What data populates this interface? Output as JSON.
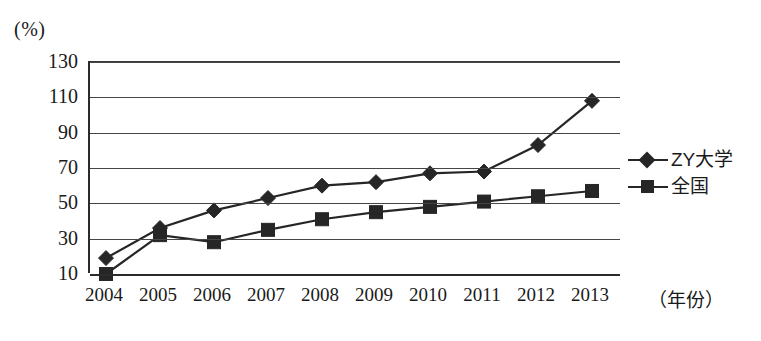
{
  "chart_data": {
    "type": "line",
    "title": "",
    "xlabel": "（年份）",
    "ylabel": "(%)",
    "unit_label": "(%)",
    "grid": true,
    "legend_position": "right",
    "ylim": [
      10,
      130
    ],
    "yticks": [
      130,
      110,
      90,
      70,
      50,
      30,
      10
    ],
    "categories": [
      "2004",
      "2005",
      "2006",
      "2007",
      "2008",
      "2009",
      "2010",
      "2011",
      "2012",
      "2013"
    ],
    "x": [
      2004,
      2005,
      2006,
      2007,
      2008,
      2009,
      2010,
      2011,
      2012,
      2013
    ],
    "series": [
      {
        "name": "ZY大学",
        "marker": "diamond",
        "color": "#262626",
        "values": [
          19,
          36,
          46,
          53,
          60,
          62,
          67,
          68,
          83,
          108
        ]
      },
      {
        "name": "全国",
        "marker": "square",
        "color": "#262626",
        "values": [
          10,
          32,
          28,
          35,
          41,
          45,
          48,
          51,
          54,
          57
        ]
      }
    ]
  },
  "legend": {
    "items": [
      {
        "label": "ZY大学",
        "marker": "diamond"
      },
      {
        "label": "全国",
        "marker": "square"
      }
    ]
  },
  "axes": {
    "y_unit": "(%)",
    "x_title": "（年份）"
  }
}
